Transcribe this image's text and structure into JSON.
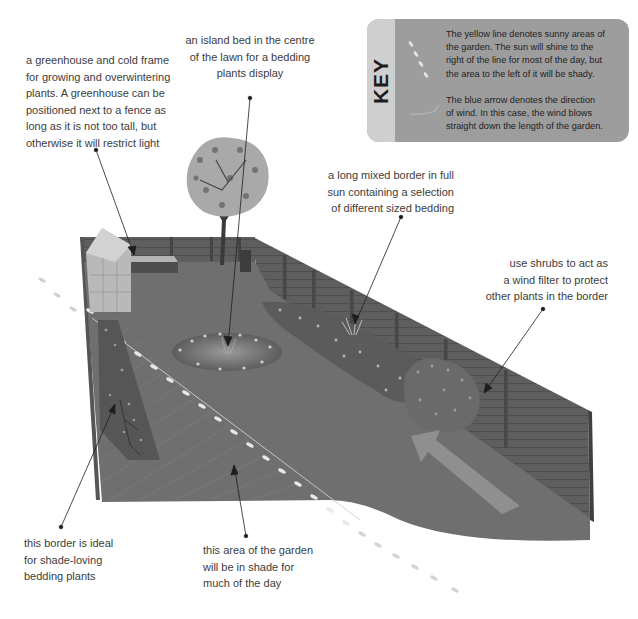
{
  "key": {
    "title": "KEY",
    "symbols": [
      "sun-line-dashes",
      "wind-arrow"
    ],
    "sun_line": {
      "color": "#f0eeb0",
      "lines": [
        "The yellow line denotes sunny areas of",
        "the garden. The sun will shine to the",
        "right of the line for most of the day, but",
        "the area to the left of it will be shady."
      ]
    },
    "wind_arrow": {
      "color": "#a8aeb8",
      "lines": [
        "The blue arrow denotes the direction",
        "of wind. In this case, the wind blows",
        "straight down the length of the garden."
      ]
    }
  },
  "annotations": {
    "greenhouse": {
      "lines": [
        "a greenhouse and cold frame",
        "for growing and overwintering",
        "plants. A greenhouse can be",
        "positioned next to a fence as",
        "long as it is not too tall, but",
        "otherwise it will restrict light"
      ]
    },
    "island_bed": {
      "lines": [
        "an island bed in the centre",
        "of the lawn for a bedding",
        "plants display"
      ]
    },
    "mixed_border": {
      "lines": [
        "a long mixed border in full",
        "sun containing a selection",
        "of different sized bedding"
      ]
    },
    "shrubs": {
      "lines": [
        "use shrubs to act as",
        "a wind filter to protect",
        "other plants in the border"
      ]
    },
    "shade_border": {
      "lines": [
        "this border is ideal",
        "for shade-loving",
        "bedding plants"
      ]
    },
    "shade_area": {
      "lines": [
        "this area of the garden",
        "will be in shade for",
        "much of the day"
      ]
    }
  },
  "scene": {
    "elements": [
      "greenhouse",
      "cold-frame",
      "tree",
      "water-butt",
      "island-bed",
      "mixed-border",
      "shrubs",
      "shade-border",
      "lawn",
      "fence",
      "sun-line",
      "wind-arrow"
    ],
    "colors": {
      "lawn": "#6e6e6e",
      "fence": "#5a5a5a",
      "fence_post": "#4a4a4a",
      "sun_dash": "#e6e6e6",
      "arrow": "#8e8e8e",
      "leader": "#222222"
    }
  }
}
